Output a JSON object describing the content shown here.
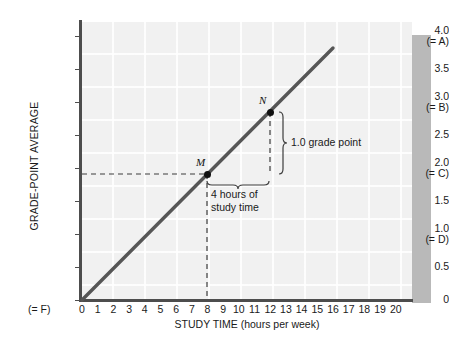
{
  "figure": {
    "background": "#ffffff",
    "plot_background": "#f1f1f1",
    "shadow_color": "#b9b9b9",
    "axis_color": "#4d4d4d",
    "line_color": "#4d4d4d",
    "point_color": "#111111"
  },
  "chart_data": {
    "type": "line",
    "title": "",
    "xlabel": "STUDY TIME (hours per week)",
    "ylabel": "GRADE-POINT AVERAGE",
    "xlim": [
      0,
      21
    ],
    "ylim": [
      0,
      4.2
    ],
    "grid": true,
    "legend": "none",
    "x_ticks": [
      "0",
      "1",
      "2",
      "3",
      "4",
      "5",
      "6",
      "7",
      "8",
      "9",
      "10",
      "11",
      "12",
      "13",
      "14",
      "15",
      "16",
      "17",
      "18",
      "19",
      "20"
    ],
    "x_origin_sub": "(= F)",
    "y_ticks": [
      {
        "main": "4.0",
        "sub": "(= A)",
        "value": 4.0
      },
      {
        "main": "3.5",
        "sub": "",
        "value": 3.5
      },
      {
        "main": "3.0",
        "sub": "(= B)",
        "value": 3.0
      },
      {
        "main": "2.5",
        "sub": "",
        "value": 2.5
      },
      {
        "main": "2.0",
        "sub": "(= C)",
        "value": 2.0
      },
      {
        "main": "1.5",
        "sub": "",
        "value": 1.5
      },
      {
        "main": "1.0",
        "sub": "(= D)",
        "value": 1.0
      },
      {
        "main": "0.5",
        "sub": "",
        "value": 0.5
      },
      {
        "main": "0",
        "sub": "",
        "value": 0.0
      }
    ],
    "series": [
      {
        "name": "grade-point average vs study time",
        "x": [
          0,
          16
        ],
        "values": [
          0.0,
          3.81
        ],
        "slope_grade_points_per_hour": 0.25
      }
    ],
    "points": [
      {
        "label": "M",
        "x": 8,
        "y": 2.0
      },
      {
        "label": "N",
        "x": 12,
        "y": 3.0
      }
    ],
    "annotations": [
      {
        "name": "vertical-brace",
        "text": "1.0 grade point",
        "from": {
          "x": 12,
          "y": 3.0
        },
        "to": {
          "x": 12,
          "y": 2.0
        }
      },
      {
        "name": "horizontal-brace",
        "text": "4 hours of\nstudy time",
        "from": {
          "x": 8,
          "y": 2.0
        },
        "to": {
          "x": 12,
          "y": 2.0
        }
      }
    ],
    "guides": [
      {
        "name": "gpa-2-horizontal-dashed",
        "y": 2.0,
        "from_x": 0,
        "to_x": 8
      },
      {
        "name": "hours-8-vertical-dashed",
        "x": 8,
        "from_y": 0,
        "to_y": 2.0
      },
      {
        "name": "hours-12-vertical-dashed",
        "x": 12,
        "from_y": 2.0,
        "to_y": 3.0
      }
    ]
  }
}
